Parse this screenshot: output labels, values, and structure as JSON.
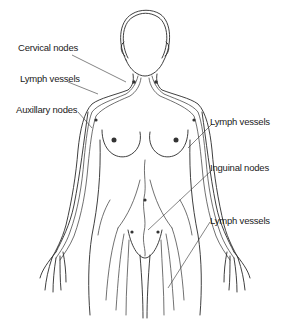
{
  "figure": {
    "labels": [
      {
        "id": "cervical-nodes",
        "text": "Cervical nodes"
      },
      {
        "id": "lymph-vessels-neck",
        "text": "Lymph vessels"
      },
      {
        "id": "auxillary-nodes",
        "text": "Auxillary nodes"
      },
      {
        "id": "lymph-vessels-arm",
        "text": "Lymph vessels"
      },
      {
        "id": "inguinal-nodes",
        "text": "Inguinal nodes"
      },
      {
        "id": "lymph-vessels-leg",
        "text": "Lymph vessels"
      }
    ],
    "colors": {
      "line": "#2a2a2a",
      "background": "#ffffff"
    }
  }
}
